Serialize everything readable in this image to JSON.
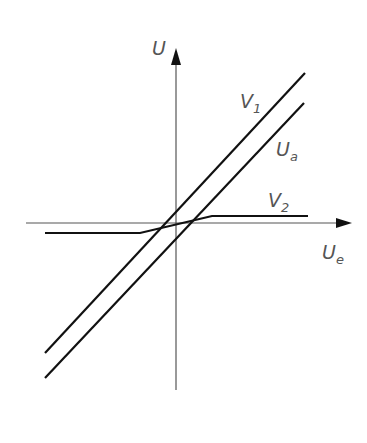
{
  "diagram": {
    "colors": {
      "axis": "#555555",
      "curve": "#111111",
      "label": "#555555",
      "background": "#ffffff"
    },
    "axes": {
      "x": {
        "label_main": "U",
        "label_sub": "e",
        "x1": 26,
        "y1": 223,
        "x2": 352,
        "y2": 223
      },
      "y": {
        "label_main": "U",
        "x1": 176,
        "y1": 390,
        "x2": 176,
        "y2": 48
      }
    },
    "curves": [
      {
        "id": "V1",
        "label_main": "V",
        "label_sub": "1",
        "points": "45,353 305,73",
        "label_x": 262,
        "label_y": 103
      },
      {
        "id": "Ua",
        "label_main": "U",
        "label_sub": "a",
        "points": "45,378 304,103",
        "label_x": 277,
        "label_y": 152
      },
      {
        "id": "V2",
        "label_main": "V",
        "label_sub": "2",
        "points": "45,233 140,233 212,216 308,216",
        "label_x": 268,
        "label_y": 208
      }
    ]
  }
}
